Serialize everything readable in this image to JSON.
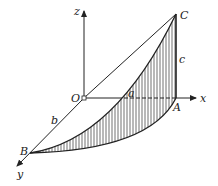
{
  "diagram": {
    "type": "3d-coordinate-figure",
    "axes": {
      "x_label": "x",
      "y_label": "y",
      "z_label": "z",
      "origin_label": "O"
    },
    "points": {
      "A": "A",
      "B": "B",
      "C": "C"
    },
    "edge_labels": {
      "a": "a",
      "b": "b",
      "c": "c"
    },
    "colors": {
      "stroke": "#222222",
      "background": "#ffffff"
    }
  }
}
